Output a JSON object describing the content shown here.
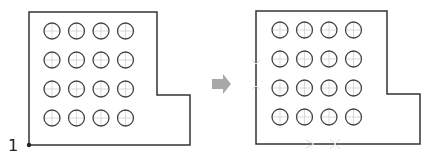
{
  "diagram": {
    "left_panel": {
      "origin_label": "1",
      "grid": {
        "rows": 4,
        "cols": 4
      }
    },
    "arrow": {
      "color": "#a8a8a8"
    },
    "right_panel": {
      "grid": {
        "rows": 4,
        "cols": 4
      },
      "faint_axis_labels": [
        "Y",
        "X"
      ]
    },
    "colors": {
      "outline": "#333333",
      "circle": "#444444",
      "crosshair": "#c8c8c8"
    }
  }
}
